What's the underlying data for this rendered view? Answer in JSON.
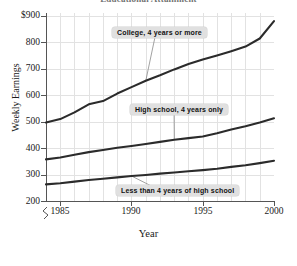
{
  "chart_data": {
    "type": "line",
    "title": "Educational Attainment",
    "xlabel": "Year",
    "ylabel": "Weekly Earnings",
    "xlim": [
      1984,
      2000
    ],
    "ylim": [
      200,
      900
    ],
    "grid": true,
    "legend_position": "inline-callouts",
    "yticks": [
      "$900",
      "800",
      "700",
      "600",
      "500",
      "400",
      "300",
      "200"
    ],
    "ytick_values": [
      900,
      800,
      700,
      600,
      500,
      400,
      300,
      200
    ],
    "xticks": [
      "1985",
      "1990",
      "1995",
      "2000"
    ],
    "xtick_values": [
      1985,
      1990,
      1995,
      2000
    ],
    "axis_break": true,
    "x": [
      1984,
      1985,
      1986,
      1987,
      1988,
      1989,
      1990,
      1991,
      1992,
      1993,
      1994,
      1995,
      1996,
      1997,
      1998,
      1999,
      2000
    ],
    "series": [
      {
        "name": "College, 4 years or more",
        "values": [
          492,
          505,
          530,
          560,
          572,
          600,
          624,
          648,
          668,
          690,
          710,
          727,
          742,
          758,
          775,
          805,
          870
        ]
      },
      {
        "name": "High school, 4 years only",
        "values": [
          355,
          362,
          372,
          382,
          390,
          398,
          405,
          412,
          420,
          428,
          434,
          440,
          452,
          466,
          478,
          492,
          508
        ]
      },
      {
        "name": "Less than 4 years of high school",
        "values": [
          262,
          266,
          272,
          278,
          283,
          288,
          293,
          297,
          302,
          306,
          311,
          315,
          320,
          327,
          333,
          341,
          350
        ]
      }
    ],
    "annotations": [
      {
        "label": "College, 4 years or more",
        "leader_to_year": 1991,
        "leader_to_value": 648
      },
      {
        "label": "High school, 4 years only",
        "leader_to_year": 1993,
        "leader_to_value": 428
      },
      {
        "label": "Less than 4 years of high school",
        "leader_to_year": 1990,
        "leader_to_value": 293
      }
    ],
    "colors": {
      "line": "#2b2b2b",
      "grid": "#e2e2e2",
      "axis": "#555555",
      "callout_bg": "#e0e0e0",
      "background": "#ffffff"
    }
  }
}
